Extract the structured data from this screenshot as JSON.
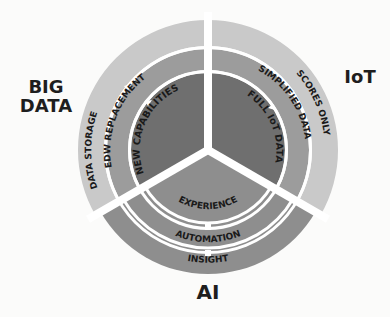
{
  "diagram": {
    "type": "three-sector concentric ring diagram",
    "center": {
      "label": "",
      "note": "three wedges meeting at center"
    },
    "sectors": [
      {
        "id": "big-data",
        "title": "BIG DATA",
        "rings": {
          "outer": "DATA STORAGE",
          "middle": "EDW REPLACEMENT",
          "inner": "NEW CAPABILITIES"
        }
      },
      {
        "id": "iot",
        "title": "IoT",
        "rings": {
          "outer": "SCORES ONLY",
          "middle": "SIMPLIFIED DATA",
          "inner": "FULL IoT DATA"
        }
      },
      {
        "id": "ai",
        "title": "AI",
        "rings": {
          "outer": "INSIGHT",
          "middle": "AUTOMATION",
          "inner": "EXPERIENCE"
        }
      }
    ]
  },
  "labels": {
    "big_data_line1": "BIG",
    "big_data_line2": "DATA",
    "iot": "IoT",
    "ai": "AI"
  },
  "colors": {
    "outer_ring": "#c9c9c9",
    "middle_ring": "#9c9c9c",
    "inner_wedge": "#6f6f6f",
    "ai_outer_ring": "#8e8e8e",
    "ai_middle_ring": "#8e8e8e",
    "ai_inner_wedge": "#8e8e8e",
    "gap": "#ffffff",
    "text": "#1a1a1a"
  }
}
